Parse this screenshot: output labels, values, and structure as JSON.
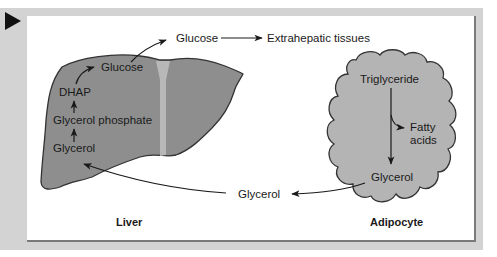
{
  "figure": {
    "marker": "play-triangle",
    "colors": {
      "frame": "#d3d3d3",
      "panel": "#ffffff",
      "liver_fill": "#8e8e8e",
      "liver_fissure": "#b8b8b8",
      "adipocyte_fill": "#b4b4b4",
      "outline": "#333333",
      "text": "#1a1a1a"
    },
    "liver": {
      "title": "Liver",
      "labels": {
        "glucose": "Glucose",
        "dhap": "DHAP",
        "glycerol_phosphate": "Glycerol phosphate",
        "glycerol": "Glycerol"
      }
    },
    "adipocyte": {
      "title": "Adipocyte",
      "labels": {
        "triglyceride": "Triglyceride",
        "fatty": "Fatty",
        "acids": "acids",
        "glycerol": "Glycerol"
      }
    },
    "between": {
      "glucose": "Glucose",
      "extrahepatic": "Extrahepatic tissues",
      "glycerol": "Glycerol"
    }
  }
}
